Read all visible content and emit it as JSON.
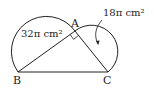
{
  "diagram": {
    "points": {
      "A": "A",
      "B": "B",
      "C": "C"
    },
    "labels": {
      "area_ab": "32π cm²",
      "area_ac": "18π cm²"
    },
    "right_angle_at": "A",
    "colors": {
      "stroke": "#222222",
      "background": "#ffffff"
    }
  }
}
